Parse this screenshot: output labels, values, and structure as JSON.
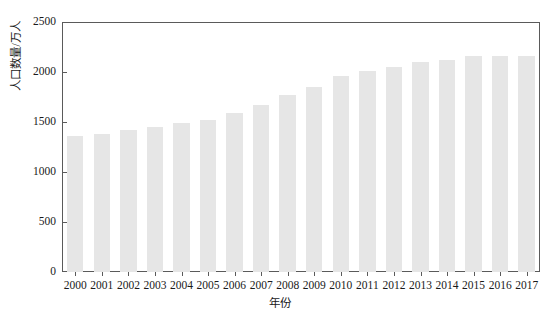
{
  "chart_data": {
    "type": "bar",
    "title": "",
    "xlabel": "年份",
    "ylabel": "人口数量/万人",
    "categories": [
      "2000",
      "2001",
      "2002",
      "2003",
      "2004",
      "2005",
      "2006",
      "2007",
      "2008",
      "2009",
      "2010",
      "2011",
      "2012",
      "2013",
      "2014",
      "2015",
      "2016",
      "2017"
    ],
    "values": [
      1360,
      1385,
      1420,
      1450,
      1495,
      1525,
      1590,
      1670,
      1770,
      1855,
      1960,
      2015,
      2055,
      2100,
      2120,
      2160,
      2160,
      2165
    ],
    "series": [
      {
        "name": "人口数量",
        "values": [
          1360,
          1385,
          1420,
          1450,
          1495,
          1525,
          1590,
          1670,
          1770,
          1855,
          1960,
          2015,
          2055,
          2100,
          2120,
          2160,
          2160,
          2165
        ]
      }
    ],
    "ylim": [
      0,
      2500
    ],
    "yticks": [
      0,
      500,
      1000,
      1500,
      2000,
      2500
    ],
    "ytick_labels": [
      "0",
      "500",
      "1000",
      "1500",
      "2000",
      "2500"
    ],
    "grid": false,
    "legend": null,
    "legend_position": "none",
    "bar_color": "#e6e6e6",
    "axis_color": "#5a5a5a",
    "text_color": "#1a1a1a"
  }
}
